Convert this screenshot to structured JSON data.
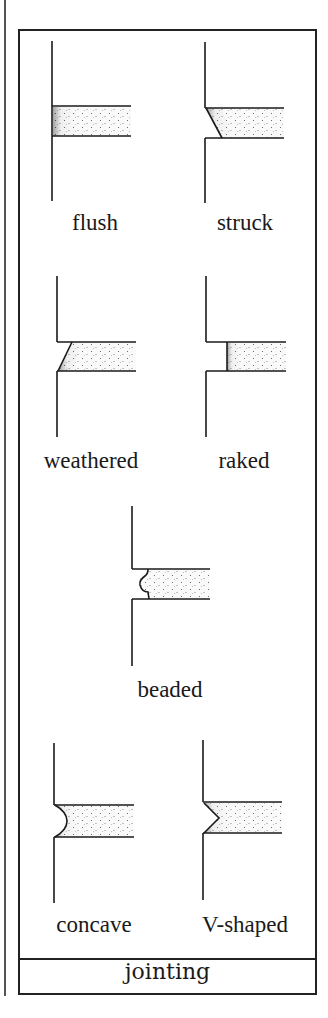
{
  "figure": {
    "caption": "jointing",
    "joints": [
      {
        "id": "flush",
        "label": "flush"
      },
      {
        "id": "struck",
        "label": "struck"
      },
      {
        "id": "weathered",
        "label": "weathered"
      },
      {
        "id": "raked",
        "label": "raked"
      },
      {
        "id": "beaded",
        "label": "beaded"
      },
      {
        "id": "concave",
        "label": "concave"
      },
      {
        "id": "v-shaped",
        "label": "V-shaped"
      }
    ]
  },
  "colors": {
    "line": "#1a1a1a",
    "background": "#ffffff",
    "mortar_stipple": "#555555"
  }
}
